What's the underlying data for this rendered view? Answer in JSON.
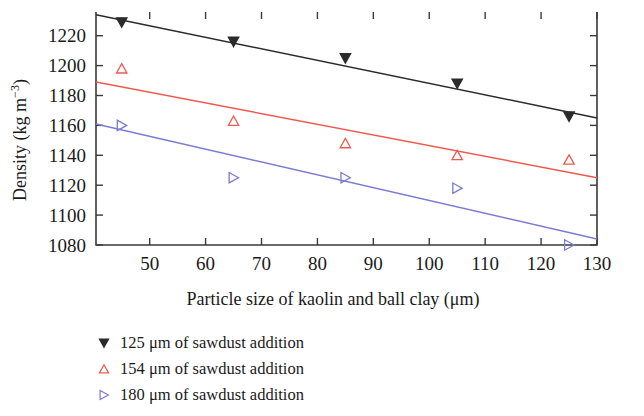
{
  "chart_data": {
    "type": "scatter",
    "title": "",
    "xlabel": "Particle size of kaolin and ball clay (μm)",
    "ylabel": "Density (kg m⁻³)",
    "xlim": [
      40.4,
      130
    ],
    "ylim": [
      1080,
      1235
    ],
    "xticks": [
      50,
      60,
      70,
      80,
      90,
      100,
      110,
      120,
      130
    ],
    "yticks": [
      1080,
      1100,
      1120,
      1140,
      1160,
      1180,
      1200,
      1220
    ],
    "grid": false,
    "legend_position": "below-left",
    "x": [
      45,
      65,
      85,
      105,
      125
    ],
    "series": [
      {
        "name": "125 μm of sawdust addition",
        "color": "#2b2b2b",
        "marker": "triangle-down-filled",
        "values": [
          1229,
          1216,
          1205,
          1188,
          1166
        ],
        "fit_line": {
          "x0": 40.4,
          "y0": 1234,
          "x1": 130,
          "y1": 1165
        }
      },
      {
        "name": "154 μm of sawdust addition",
        "color": "#ee5a50",
        "marker": "triangle-up-open",
        "values": [
          1198,
          1163,
          1148,
          1140,
          1137
        ],
        "fit_line": {
          "x0": 40.4,
          "y0": 1189,
          "x1": 130,
          "y1": 1125
        }
      },
      {
        "name": "180 μm of sawdust addition",
        "color": "#7b7bd0",
        "marker": "triangle-right-open",
        "values": [
          1160,
          1125,
          1125,
          1118,
          1080
        ],
        "fit_line": {
          "x0": 40.4,
          "y0": 1161,
          "x1": 130,
          "y1": 1084
        }
      }
    ]
  },
  "axis": {
    "x_tick_labels": [
      "50",
      "60",
      "70",
      "80",
      "90",
      "100",
      "110",
      "120",
      "130"
    ],
    "y_tick_labels": [
      "1080",
      "1100",
      "1120",
      "1140",
      "1160",
      "1180",
      "1200",
      "1220"
    ],
    "x_title": "Particle size of kaolin and ball clay (μm)",
    "y_title_main": "Density (kg m",
    "y_title_exp": "−3",
    "y_title_close": ")"
  },
  "legend": {
    "items": [
      {
        "label": "125 μm of sawdust addition",
        "icon": "triangle-down-icon",
        "color": "#2b2b2b"
      },
      {
        "label": "154 μm of sawdust addition",
        "icon": "triangle-up-icon",
        "color": "#ee5a50"
      },
      {
        "label": "180 μm of sawdust addition",
        "icon": "triangle-right-icon",
        "color": "#7b7bd0"
      }
    ]
  }
}
